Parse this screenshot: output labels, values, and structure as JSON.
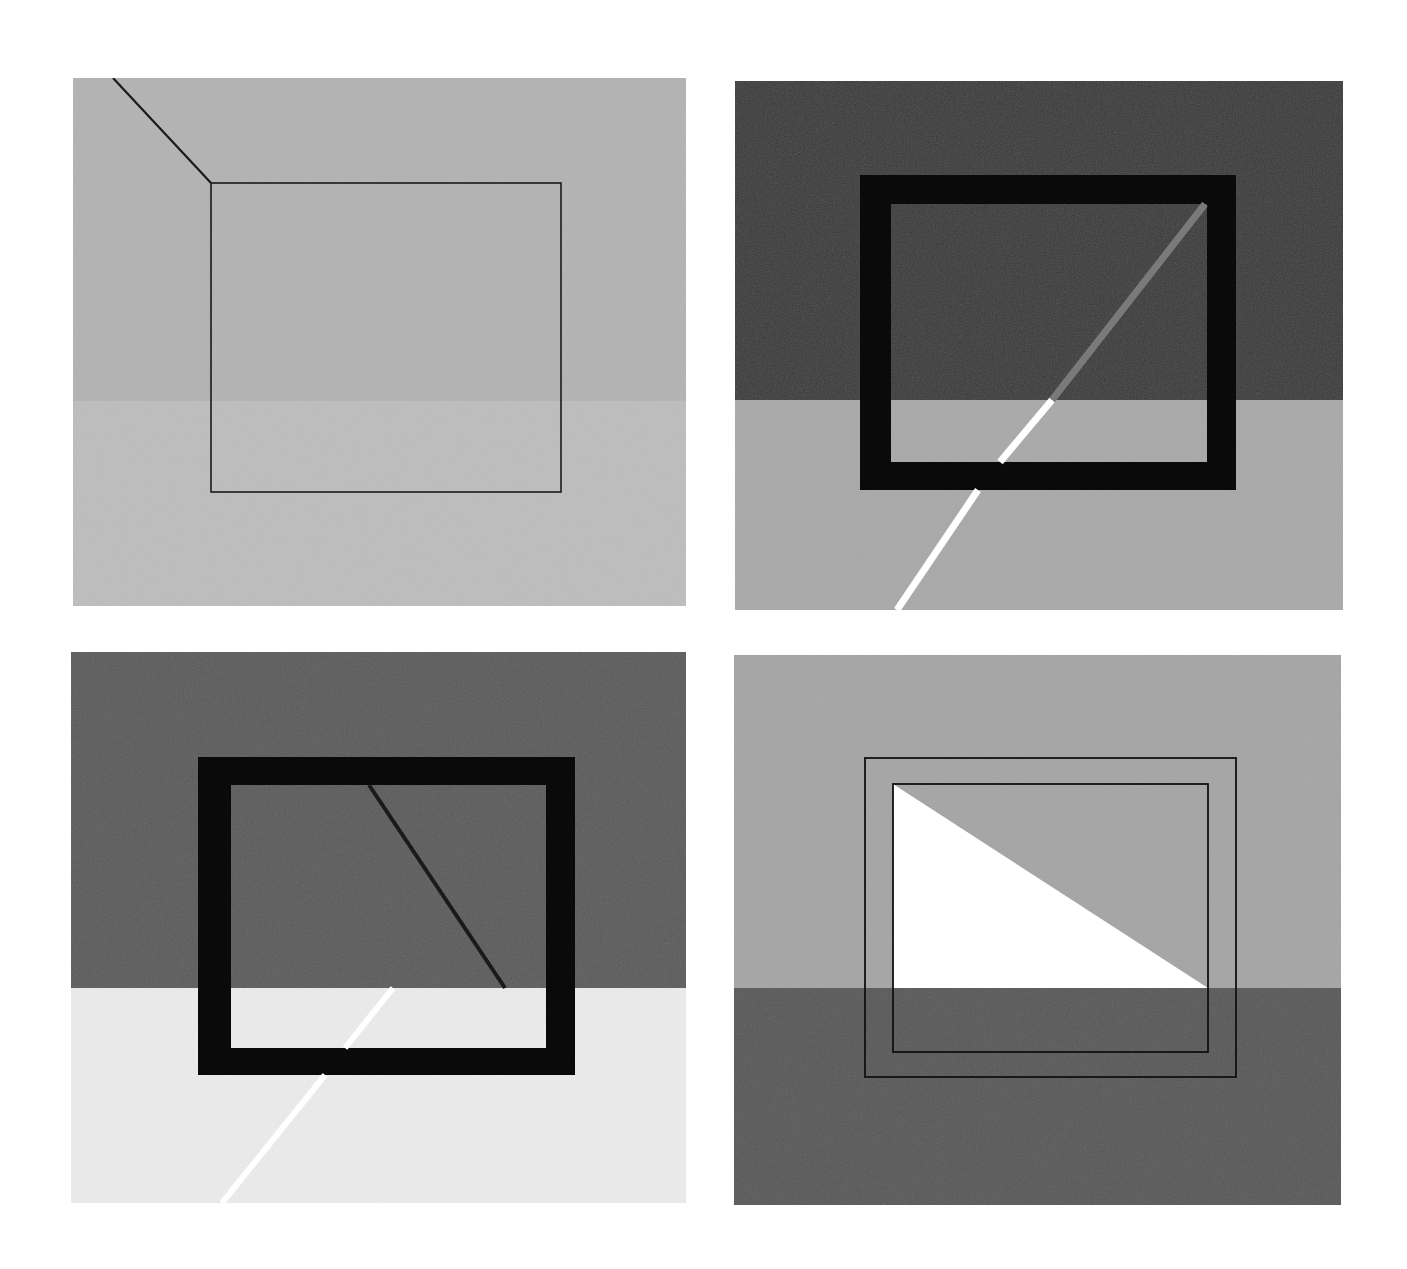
{
  "figure": {
    "width": 1407,
    "height": 1269,
    "background": "#ffffff",
    "panels": [
      {
        "id": "panel-top-left",
        "x": 73,
        "y": 78,
        "w": 613,
        "h": 528,
        "horizon_y": 401,
        "top_color": "#b3b3b3",
        "bottom_color": "#bdbdbd",
        "frame": {
          "style": "thin-outline",
          "outer": {
            "x": 211,
            "y": 183,
            "w": 350,
            "h": 309
          },
          "stroke": "#1a1a1a",
          "stroke_width": 1.6
        },
        "lines": [
          {
            "name": "dark-diagonal-line",
            "x1": 113,
            "y1": 78,
            "x2": 211,
            "y2": 183,
            "color": "#1a1a1a",
            "width": 2.2
          }
        ]
      },
      {
        "id": "panel-top-right",
        "x": 735,
        "y": 81,
        "w": 608,
        "h": 529,
        "horizon_y": 400,
        "top_color": "#3a3a3a",
        "bottom_color": "#a9a9a9",
        "frame": {
          "style": "thick-frame",
          "outer": {
            "x": 860,
            "y": 175,
            "w": 376,
            "h": 315
          },
          "inner": {
            "x": 891,
            "y": 204,
            "w": 316,
            "h": 258
          },
          "color": "#0a0a0a"
        },
        "lines": [
          {
            "name": "gray-stripe-upper",
            "x1": 1205,
            "y1": 204,
            "x2": 1052,
            "y2": 400,
            "color": "#7a7a7a",
            "width": 7
          },
          {
            "name": "white-stripe-inside",
            "x1": 1052,
            "y1": 400,
            "x2": 1000,
            "y2": 462,
            "color": "#ffffff",
            "width": 7
          },
          {
            "name": "white-stripe-below",
            "x1": 978,
            "y1": 490,
            "x2": 897,
            "y2": 610,
            "color": "#ffffff",
            "width": 7
          }
        ]
      },
      {
        "id": "panel-bottom-left",
        "x": 71,
        "y": 652,
        "w": 615,
        "h": 551,
        "horizon_y": 988,
        "top_color": "#5c5c5c",
        "bottom_color": "#ebebeb",
        "frame": {
          "style": "thick-frame",
          "outer": {
            "x": 198,
            "y": 757,
            "w": 377,
            "h": 318
          },
          "inner": {
            "x": 231,
            "y": 785,
            "w": 315,
            "h": 263
          },
          "color": "#0a0a0a"
        },
        "lines": [
          {
            "name": "dark-diagonal-line",
            "x1": 369,
            "y1": 785,
            "x2": 505,
            "y2": 988,
            "color": "#1a1a1a",
            "width": 4
          },
          {
            "name": "white-stripe-inside",
            "x1": 393,
            "y1": 988,
            "x2": 345,
            "y2": 1048,
            "color": "#ffffff",
            "width": 6
          },
          {
            "name": "white-stripe-below",
            "x1": 325,
            "y1": 1075,
            "x2": 222,
            "y2": 1203,
            "color": "#ffffff",
            "width": 6
          }
        ]
      },
      {
        "id": "panel-bottom-right",
        "x": 734,
        "y": 655,
        "w": 607,
        "h": 550,
        "horizon_y": 988,
        "top_color": "#a5a5a5",
        "bottom_color": "#595959",
        "frame": {
          "style": "double-outline",
          "outer": {
            "x": 865,
            "y": 758,
            "w": 371,
            "h": 319
          },
          "inner": {
            "x": 893,
            "y": 784,
            "w": 315,
            "h": 268
          },
          "stroke": "#111111",
          "stroke_width": 1.8
        },
        "triangle": {
          "name": "white-triangle",
          "points": "893,784 893,988 1208,988",
          "color": "#ffffff"
        },
        "lines": []
      }
    ]
  }
}
